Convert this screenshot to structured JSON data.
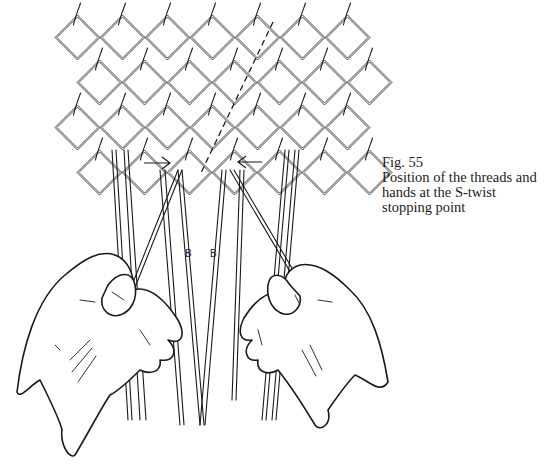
{
  "figure": {
    "number_label": "Fig. 55",
    "caption_lines": [
      "Position of the threads and",
      "hands at the S-twist",
      "stopping point"
    ],
    "thread_labels": [
      "B",
      "B"
    ],
    "illustration": "line drawing of sprang/plaited mesh of twisted threads held by two hands, with arrows marking the S-twist stopping point and a dashed guide line"
  }
}
